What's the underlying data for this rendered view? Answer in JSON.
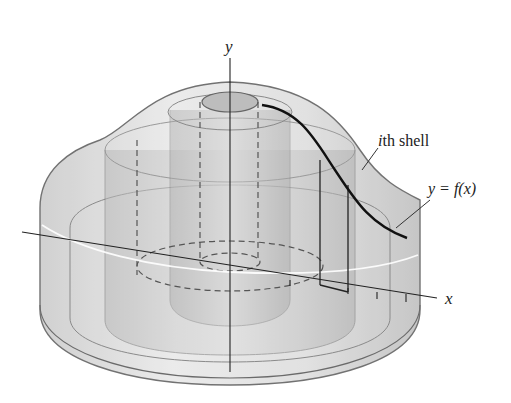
{
  "figure": {
    "labels": {
      "y_axis": "y",
      "x_axis": "x",
      "shell_label_italic": "i",
      "shell_label_rest": "th shell",
      "curve_label": "y = f(x)"
    }
  }
}
